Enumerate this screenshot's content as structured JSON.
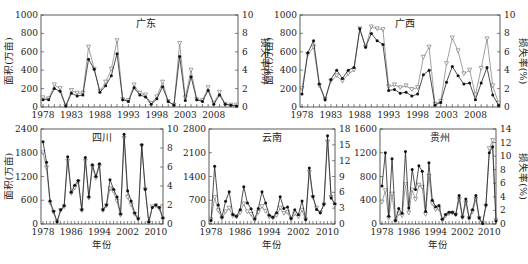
{
  "chart_data": [
    {
      "type": "line",
      "title": "广东",
      "ylabel": "面积(万亩)",
      "y2label": "损失率(%)",
      "xlabel": "",
      "x_range": [
        1978,
        2012
      ],
      "xticks": [
        1978,
        1983,
        1988,
        1993,
        1998,
        2003,
        2008
      ],
      "ylim": [
        0,
        1000
      ],
      "yticks": [
        0,
        200,
        400,
        600,
        800,
        1000
      ],
      "y2lim": [
        0,
        10
      ],
      "y2ticks": [
        0,
        2,
        4,
        6,
        8,
        10
      ],
      "x": [
        1978,
        1979,
        1980,
        1981,
        1982,
        1983,
        1984,
        1985,
        1986,
        1987,
        1988,
        1989,
        1990,
        1991,
        1992,
        1993,
        1994,
        1995,
        1996,
        1997,
        1998,
        1999,
        2000,
        2001,
        2002,
        2003,
        2004,
        2005,
        2006,
        2007,
        2008,
        2009,
        2010,
        2011,
        2012
      ],
      "series": [
        {
          "name": "面积",
          "marker": "filled-circle",
          "axis": "left",
          "values": [
            80,
            80,
            200,
            170,
            10,
            150,
            120,
            130,
            520,
            410,
            160,
            230,
            340,
            580,
            80,
            60,
            210,
            130,
            110,
            30,
            90,
            220,
            60,
            20,
            550,
            70,
            330,
            80,
            60,
            180,
            30,
            130,
            30,
            20,
            10
          ]
        },
        {
          "name": "损失率",
          "marker": "open-triangle",
          "axis": "right",
          "values": [
            1.0,
            0.9,
            2.4,
            2.0,
            0.1,
            1.8,
            1.5,
            1.5,
            6.5,
            4.1,
            1.7,
            2.7,
            4.1,
            7.2,
            0.8,
            0.7,
            2.4,
            1.5,
            1.3,
            0.4,
            1.1,
            2.7,
            0.6,
            0.2,
            6.9,
            1.0,
            4.0,
            0.8,
            0.7,
            2.1,
            0.4,
            1.6,
            0.3,
            0.2,
            0.2
          ]
        }
      ]
    },
    {
      "type": "line",
      "title": "广西",
      "ylabel": "面积(万亩)",
      "y2label": "损失率(%)",
      "xlabel": "",
      "x_range": [
        1978,
        2012
      ],
      "xticks": [
        1978,
        1983,
        1988,
        1993,
        1998,
        2003,
        2008
      ],
      "ylim": [
        0,
        1000
      ],
      "yticks": [
        0,
        200,
        400,
        600,
        800,
        1000
      ],
      "y2lim": [
        0,
        10
      ],
      "y2ticks": [
        0,
        2,
        4,
        6,
        8,
        10
      ],
      "x": [
        1978,
        1979,
        1980,
        1981,
        1982,
        1983,
        1984,
        1985,
        1986,
        1987,
        1988,
        1989,
        1990,
        1991,
        1992,
        1993,
        1994,
        1995,
        1996,
        1997,
        1998,
        1999,
        2000,
        2001,
        2002,
        2003,
        2004,
        2005,
        2006,
        2007,
        2008,
        2009,
        2010,
        2011,
        2012
      ],
      "series": [
        {
          "name": "面积",
          "marker": "filled-circle",
          "axis": "left",
          "values": [
            140,
            590,
            720,
            250,
            80,
            300,
            400,
            310,
            400,
            430,
            850,
            650,
            800,
            720,
            680,
            180,
            190,
            150,
            160,
            120,
            140,
            350,
            400,
            20,
            50,
            270,
            440,
            340,
            250,
            260,
            80,
            260,
            430,
            130,
            20
          ]
        },
        {
          "name": "损失率",
          "marker": "open-triangle",
          "axis": "right",
          "values": [
            2.0,
            5.7,
            6.5,
            2.3,
            0.8,
            2.8,
            3.4,
            2.8,
            3.6,
            4.0,
            8.5,
            6.5,
            8.7,
            8.5,
            8.4,
            2.2,
            2.4,
            2.1,
            2.3,
            1.9,
            2.1,
            5.4,
            6.5,
            0.3,
            0.6,
            4.7,
            7.5,
            6.1,
            3.6,
            4.0,
            1.3,
            4.2,
            7.4,
            2.3,
            0.4
          ]
        }
      ]
    },
    {
      "type": "line",
      "title": "四川",
      "ylabel": "面积(万亩)",
      "xlabel": "年份",
      "x_range": [
        1978,
        2012
      ],
      "xticks": [
        1978,
        1986,
        1994,
        2002,
        2010
      ],
      "ylim": [
        0,
        2400
      ],
      "yticks": [
        0,
        600,
        1200,
        1800,
        2400
      ],
      "y2lim": [
        0,
        10
      ],
      "y2ticks": [
        0,
        2,
        4,
        6,
        8,
        10
      ],
      "x": [
        1978,
        1979,
        1980,
        1981,
        1982,
        1983,
        1984,
        1985,
        1986,
        1987,
        1988,
        1989,
        1990,
        1991,
        1992,
        1993,
        1994,
        1995,
        1996,
        1997,
        1998,
        1999,
        2000,
        2001,
        2002,
        2003,
        2004,
        2005,
        2006,
        2007,
        2008,
        2009,
        2010,
        2011,
        2012
      ],
      "series": [
        {
          "name": "面积",
          "marker": "filled-circle",
          "axis": "left",
          "values": [
            2080,
            1560,
            580,
            320,
            60,
            360,
            460,
            1700,
            800,
            980,
            1100,
            360,
            1680,
            680,
            1500,
            1200,
            1520,
            360,
            480,
            1120,
            880,
            680,
            250,
            2270,
            840,
            580,
            280,
            130,
            2000,
            880,
            50,
            420,
            480,
            420,
            150
          ]
        },
        {
          "name": "损失率",
          "marker": "open-triangle",
          "axis": "right",
          "values": [
            7.5,
            5.9,
            2.2,
            1.2,
            0.2,
            1.4,
            1.8,
            6.6,
            3.2,
            3.8,
            4.4,
            1.4,
            6.6,
            2.7,
            6.0,
            4.8,
            6.1,
            1.4,
            1.9,
            3.7,
            3.4,
            2.4,
            0.9,
            9.0,
            2.8,
            2.0,
            1.0,
            0.5,
            8.2,
            3.6,
            0.1,
            1.8,
            1.9,
            1.6,
            0.5
          ]
        }
      ]
    },
    {
      "type": "line",
      "title": "云南",
      "ylabel": "",
      "xlabel": "年份",
      "x_range": [
        1978,
        2012
      ],
      "xticks": [
        1978,
        1986,
        1994,
        2002,
        2010
      ],
      "ylim": [
        0,
        2800
      ],
      "yticks": [
        0,
        700,
        1400,
        2100,
        2800
      ],
      "y2lim": [
        0,
        18
      ],
      "y2ticks": [
        0,
        3,
        6,
        9,
        12,
        15,
        18
      ],
      "x": [
        1978,
        1979,
        1980,
        1981,
        1982,
        1983,
        1984,
        1985,
        1986,
        1987,
        1988,
        1989,
        1990,
        1991,
        1992,
        1993,
        1994,
        1995,
        1996,
        1997,
        1998,
        1999,
        2000,
        2001,
        2002,
        2003,
        2004,
        2005,
        2006,
        2007,
        2008,
        2009,
        2010,
        2011,
        2012
      ],
      "series": [
        {
          "name": "面积",
          "marker": "filled-circle",
          "axis": "left",
          "values": [
            100,
            1700,
            560,
            200,
            670,
            950,
            280,
            230,
            420,
            1100,
            620,
            450,
            150,
            460,
            950,
            620,
            260,
            200,
            330,
            800,
            460,
            500,
            160,
            420,
            270,
            680,
            130,
            1650,
            810,
            430,
            330,
            580,
            2600,
            770,
            600
          ]
        },
        {
          "name": "损失率",
          "marker": "open-triangle",
          "axis": "right",
          "values": [
            0.8,
            5.0,
            2.5,
            1.0,
            2.3,
            3.0,
            1.5,
            1.3,
            2.1,
            3.8,
            2.3,
            1.8,
            0.7,
            2.2,
            3.3,
            2.4,
            1.3,
            1.1,
            1.6,
            3.0,
            2.0,
            2.2,
            0.8,
            1.9,
            1.3,
            2.6,
            0.8,
            9.8,
            5.0,
            3.0,
            2.1,
            3.6,
            15.5,
            5.0,
            3.5
          ]
        }
      ]
    },
    {
      "type": "line",
      "title": "贵州",
      "ylabel": "",
      "y2label": "损失率(%)",
      "xlabel": "年份",
      "x_range": [
        1978,
        2012
      ],
      "xticks": [
        1978,
        1986,
        1994,
        2002,
        2010
      ],
      "ylim": [
        0,
        1600
      ],
      "yticks": [
        0,
        400,
        800,
        1200,
        1600
      ],
      "y2lim": [
        0,
        14
      ],
      "y2ticks": [
        0,
        2,
        4,
        6,
        8,
        10,
        12,
        14
      ],
      "x": [
        1978,
        1979,
        1980,
        1981,
        1982,
        1983,
        1984,
        1985,
        1986,
        1987,
        1988,
        1989,
        1990,
        1991,
        1992,
        1993,
        1994,
        1995,
        1996,
        1997,
        1998,
        1999,
        2000,
        2001,
        2002,
        2003,
        2004,
        2005,
        2006,
        2007,
        2008,
        2009,
        2010,
        2011,
        2012
      ],
      "series": [
        {
          "name": "面积",
          "marker": "filled-circle",
          "axis": "left",
          "values": [
            640,
            1200,
            130,
            1100,
            60,
            260,
            180,
            1220,
            270,
            920,
            580,
            980,
            890,
            210,
            1030,
            400,
            290,
            310,
            80,
            160,
            200,
            200,
            160,
            480,
            120,
            420,
            100,
            240,
            480,
            100,
            10,
            320,
            1200,
            1300,
            50
          ]
        },
        {
          "name": "损失率",
          "marker": "open-triangle",
          "axis": "right",
          "values": [
            3.2,
            4.9,
            0.8,
            4.4,
            0.3,
            1.5,
            1.2,
            5.8,
            1.6,
            5.0,
            3.6,
            5.7,
            5.4,
            1.4,
            7.0,
            3.0,
            2.1,
            2.2,
            0.5,
            1.2,
            1.5,
            1.6,
            1.3,
            3.6,
            0.9,
            3.1,
            0.8,
            1.8,
            3.6,
            0.8,
            0.1,
            2.6,
            11.1,
            12.3,
            0.5
          ]
        }
      ]
    }
  ],
  "panels": [
    {
      "title": "广东",
      "ylabel": "面积(万亩)",
      "y2label": "损失率(%)"
    },
    {
      "title": "广西",
      "ylabel": "面积(万亩)",
      "y2label": "损失率(%)"
    },
    {
      "title": "四川",
      "ylabel": "面积(万亩)",
      "xlabel": "年份"
    },
    {
      "title": "云南",
      "xlabel": "年份"
    },
    {
      "title": "贵州",
      "y2label": "损失率(%)",
      "xlabel": "年份"
    }
  ]
}
